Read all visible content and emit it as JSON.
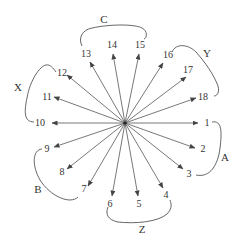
{
  "diagram": {
    "type": "radial-arrows",
    "center": [
      125,
      123
    ],
    "nodes": [
      {
        "id": "1",
        "label": "1",
        "tip": [
          198,
          123
        ],
        "text": [
          207,
          126
        ]
      },
      {
        "id": "2",
        "label": "2",
        "tip": [
          195,
          148
        ],
        "text": [
          203,
          152
        ]
      },
      {
        "id": "3",
        "label": "3",
        "tip": [
          183,
          169
        ],
        "text": [
          189,
          177
        ]
      },
      {
        "id": "4",
        "label": "4",
        "tip": [
          163,
          188
        ],
        "text": [
          166,
          198
        ]
      },
      {
        "id": "5",
        "label": "5",
        "tip": [
          138,
          196
        ],
        "text": [
          139,
          207
        ]
      },
      {
        "id": "6",
        "label": "6",
        "tip": [
          112,
          196
        ],
        "text": [
          110,
          207
        ]
      },
      {
        "id": "7",
        "label": "7",
        "tip": [
          88,
          186
        ],
        "text": [
          84,
          192
        ]
      },
      {
        "id": "8",
        "label": "8",
        "tip": [
          67,
          169
        ],
        "text": [
          62,
          175
        ]
      },
      {
        "id": "9",
        "label": "9",
        "tip": [
          54,
          147
        ],
        "text": [
          47,
          152
        ]
      },
      {
        "id": "10",
        "label": "10",
        "tip": [
          52,
          123
        ],
        "text": [
          40,
          126
        ]
      },
      {
        "id": "11",
        "label": "11",
        "tip": [
          54,
          97
        ],
        "text": [
          47,
          100
        ]
      },
      {
        "id": "12",
        "label": "12",
        "tip": [
          67,
          75
        ],
        "text": [
          62,
          76
        ]
      },
      {
        "id": "13",
        "label": "13",
        "tip": [
          90,
          62
        ],
        "text": [
          86,
          57
        ]
      },
      {
        "id": "14",
        "label": "14",
        "tip": [
          113,
          54
        ],
        "text": [
          112,
          48
        ]
      },
      {
        "id": "15",
        "label": "15",
        "tip": [
          139,
          54
        ],
        "text": [
          140,
          48
        ]
      },
      {
        "id": "16",
        "label": "16",
        "tip": [
          163,
          63
        ],
        "text": [
          168,
          58
        ]
      },
      {
        "id": "17",
        "label": "17",
        "tip": [
          186,
          77
        ],
        "text": [
          188,
          73
        ]
      },
      {
        "id": "18",
        "label": "18",
        "tip": [
          196,
          98
        ],
        "text": [
          203,
          100
        ]
      }
    ],
    "groups": [
      {
        "id": "A",
        "label": "A",
        "members": [
          "1",
          "2",
          "3"
        ],
        "text": [
          225,
          161
        ],
        "path": "M212,122 C222,120 222,132 220,148 C218,165 210,178 196,175"
      },
      {
        "id": "B",
        "label": "B",
        "members": [
          "7",
          "8",
          "9"
        ],
        "text": [
          38,
          193
        ],
        "path": "M42,149 C32,150 32,166 40,180 C50,196 70,205 78,197"
      },
      {
        "id": "C",
        "label": "C",
        "members": [
          "13",
          "14",
          "15"
        ],
        "text": [
          104,
          23
        ],
        "path": "M82,46 C78,38 82,30 92,28 C110,24 135,24 142,28 C148,31 147,38 144,39"
      },
      {
        "id": "X",
        "label": "X",
        "members": [
          "10",
          "11",
          "12"
        ],
        "text": [
          18,
          91
        ],
        "path": "M34,122 C24,122 24,112 27,98 C30,80 40,66 46,65 C50,64 53,68 56,72"
      },
      {
        "id": "Y",
        "label": "Y",
        "members": [
          "16",
          "17",
          "18"
        ],
        "text": [
          207,
          57
        ],
        "path": "M172,52 C176,43 188,44 196,52 C205,62 214,75 218,86 C220,94 216,96 214,96"
      },
      {
        "id": "Z",
        "label": "Z",
        "members": [
          "4",
          "5",
          "6"
        ],
        "text": [
          142,
          233
        ],
        "path": "M108,207 C105,214 108,220 118,222 C135,224 158,222 167,214 C173,208 171,203 170,200"
      }
    ]
  }
}
